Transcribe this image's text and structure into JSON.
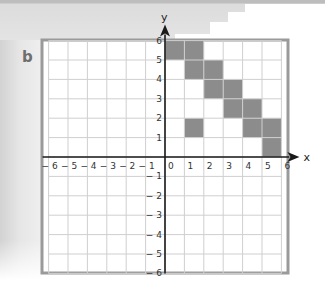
{
  "part_label": "b",
  "axes": {
    "x_label": "x",
    "y_label": "y",
    "x_range": [
      -6,
      6
    ],
    "y_range": [
      -6,
      6
    ],
    "x_ticks": [
      "-6",
      "-5",
      "-4",
      "-3",
      "-2",
      "-1",
      "0",
      "1",
      "2",
      "3",
      "4",
      "5",
      "6"
    ],
    "y_ticks": [
      "6",
      "5",
      "4",
      "3",
      "2",
      "1",
      "-1",
      "-2",
      "-3",
      "-4",
      "-5",
      "-6"
    ]
  },
  "colors": {
    "frame": "#9a9a9a",
    "grid": "#cfcfcf",
    "shade": "#8c8c8c",
    "axis": "#1a1a1a"
  },
  "shaded_cells": [
    {
      "x": 0,
      "y": 5
    },
    {
      "x": 1,
      "y": 5
    },
    {
      "x": 1,
      "y": 4
    },
    {
      "x": 2,
      "y": 4
    },
    {
      "x": 2,
      "y": 3
    },
    {
      "x": 3,
      "y": 3
    },
    {
      "x": 3,
      "y": 2
    },
    {
      "x": 4,
      "y": 2
    },
    {
      "x": 1,
      "y": 1
    },
    {
      "x": 4,
      "y": 1
    },
    {
      "x": 5,
      "y": 1
    },
    {
      "x": 5,
      "y": 0
    }
  ],
  "chart_data": {
    "type": "grid-diagram",
    "title": "b",
    "xlabel": "x",
    "ylabel": "y",
    "xlim": [
      -6,
      6
    ],
    "ylim": [
      -6,
      6
    ],
    "grid": true,
    "shaded_unit_squares_lower_left": [
      [
        0,
        5
      ],
      [
        1,
        5
      ],
      [
        1,
        4
      ],
      [
        2,
        4
      ],
      [
        2,
        3
      ],
      [
        3,
        3
      ],
      [
        3,
        2
      ],
      [
        4,
        2
      ],
      [
        1,
        1
      ],
      [
        4,
        1
      ],
      [
        5,
        1
      ],
      [
        5,
        0
      ]
    ]
  }
}
